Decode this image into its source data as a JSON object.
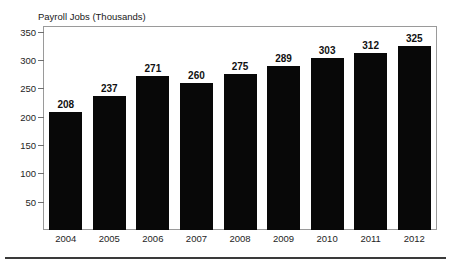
{
  "clipped_heading": "",
  "figure": {
    "axis_title": "Payroll Jobs (Thousands)"
  },
  "chart_data": {
    "type": "bar",
    "title": "",
    "subtitle": "",
    "xlabel": "",
    "ylabel": "Payroll Jobs (Thousands)",
    "categories": [
      "2004",
      "2005",
      "2006",
      "2007",
      "2008",
      "2009",
      "2010",
      "2011",
      "2012"
    ],
    "values": [
      208,
      237,
      271,
      260,
      275,
      289,
      303,
      312,
      325
    ],
    "data_labels": [
      "208",
      "237",
      "271",
      "260",
      "275",
      "289",
      "303",
      "312",
      "325"
    ],
    "ylim": [
      0,
      358
    ],
    "yticks": [
      50,
      100,
      150,
      200,
      250,
      300,
      350
    ],
    "ytick_labels": [
      "50",
      "100",
      "150",
      "200",
      "250",
      "300",
      "350"
    ],
    "grid": false,
    "legend": null,
    "legend_position": "none",
    "bar_color": "#080808",
    "frame_color": "#9a9a9a",
    "background_color": "#ffffff",
    "orientation": "vertical",
    "annotations": []
  }
}
